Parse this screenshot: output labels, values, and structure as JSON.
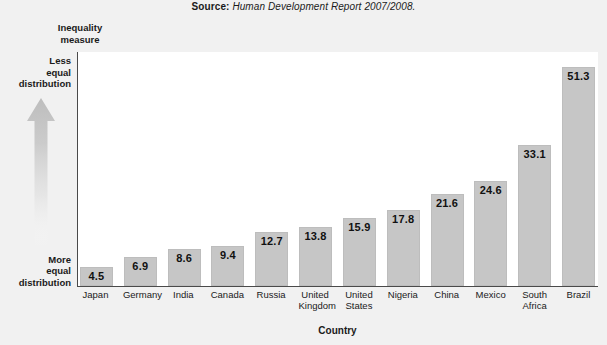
{
  "source": {
    "label": "Source:",
    "text": "Human Development Report 2007/2008."
  },
  "y_axis": {
    "caption_line1": "Inequality",
    "caption_line2": "measure",
    "top_annotation": {
      "line1": "Less",
      "line2": "equal",
      "line3": "distribution"
    },
    "bottom_annotation": {
      "line1": "More",
      "line2": "equal",
      "line3": "distribution"
    }
  },
  "x_axis": {
    "title": "Country"
  },
  "colors": {
    "bar_fill": "#c6c6c6",
    "axis_line": "#4a4a4a",
    "plot_background": "#ffffff",
    "page_background": "#f1f1f1",
    "text": "#1a1a1a"
  },
  "chart_data": {
    "type": "bar",
    "title": "",
    "subtitle": "",
    "xlabel": "Country",
    "ylabel": "Inequality measure",
    "ylim": [
      0,
      55
    ],
    "grid": false,
    "legend": "none",
    "annotations": [
      "Less equal distribution",
      "More equal distribution",
      "Source: Human Development Report 2007/2008."
    ],
    "categories": [
      "Japan",
      "Germany",
      "India",
      "Canada",
      "Russia",
      "United Kingdom",
      "United States",
      "Nigeria",
      "China",
      "Mexico",
      "South Africa",
      "Brazil"
    ],
    "values": [
      4.5,
      6.9,
      8.6,
      9.4,
      12.7,
      13.8,
      15.9,
      17.8,
      21.6,
      24.6,
      33.1,
      51.3
    ],
    "bars": [
      {
        "category": "Japan",
        "label_line1": "Japan",
        "label_line2": "",
        "value": 4.5,
        "value_label": "4.5",
        "label_inside": true
      },
      {
        "category": "Germany",
        "label_line1": "Germany",
        "label_line2": "",
        "value": 6.9,
        "value_label": "6.9",
        "label_inside": true
      },
      {
        "category": "India",
        "label_line1": "India",
        "label_line2": "",
        "value": 8.6,
        "value_label": "8.6",
        "label_inside": true
      },
      {
        "category": "Canada",
        "label_line1": "Canada",
        "label_line2": "",
        "value": 9.4,
        "value_label": "9.4",
        "label_inside": true
      },
      {
        "category": "Russia",
        "label_line1": "Russia",
        "label_line2": "",
        "value": 12.7,
        "value_label": "12.7",
        "label_inside": true
      },
      {
        "category": "United Kingdom",
        "label_line1": "United",
        "label_line2": "Kingdom",
        "value": 13.8,
        "value_label": "13.8",
        "label_inside": true
      },
      {
        "category": "United States",
        "label_line1": "United",
        "label_line2": "States",
        "value": 15.9,
        "value_label": "15.9",
        "label_inside": true
      },
      {
        "category": "Nigeria",
        "label_line1": "Nigeria",
        "label_line2": "",
        "value": 17.8,
        "value_label": "17.8",
        "label_inside": true
      },
      {
        "category": "China",
        "label_line1": "China",
        "label_line2": "",
        "value": 21.6,
        "value_label": "21.6",
        "label_inside": true
      },
      {
        "category": "Mexico",
        "label_line1": "Mexico",
        "label_line2": "",
        "value": 24.6,
        "value_label": "24.6",
        "label_inside": true
      },
      {
        "category": "South Africa",
        "label_line1": "South",
        "label_line2": "Africa",
        "value": 33.1,
        "value_label": "33.1",
        "label_inside": true
      },
      {
        "category": "Brazil",
        "label_line1": "Brazil",
        "label_line2": "",
        "value": 51.3,
        "value_label": "51.3",
        "label_inside": true
      }
    ]
  }
}
